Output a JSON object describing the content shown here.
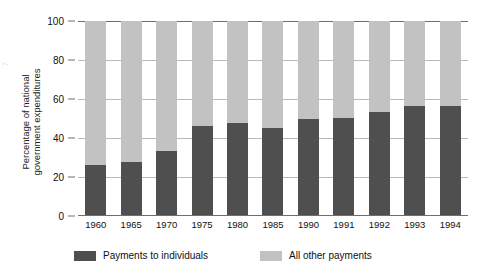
{
  "margin_fragment": "7",
  "chart_data": {
    "type": "bar",
    "stacked": true,
    "title": "",
    "subtitle": "",
    "xlabel": "",
    "ylabel": "Percentage of national government expenditures",
    "ylabel_lines": [
      "Percentage of national",
      "government expenditures"
    ],
    "ylim": [
      0,
      100
    ],
    "yticks": [
      0,
      20,
      40,
      60,
      80,
      100
    ],
    "ytick_labels": [
      "0",
      "20",
      "40",
      "60",
      "80",
      "100"
    ],
    "grid": true,
    "grid_axis": "y",
    "legend_position": "bottom",
    "categories": [
      "1960",
      "1965",
      "1970",
      "1975",
      "1980",
      "1985",
      "1990",
      "1991",
      "1992",
      "1993",
      "1994"
    ],
    "series": [
      {
        "name": "Payments to individuals",
        "color": "#4f4f4f",
        "values": [
          26,
          27.5,
          33.5,
          46,
          47.5,
          45,
          49.5,
          50.5,
          53.5,
          56.5,
          56.5
        ]
      },
      {
        "name": "All other payments",
        "color": "#c2c2c2",
        "values": [
          74,
          72.5,
          66.5,
          54,
          52.5,
          55,
          50.5,
          49.5,
          46.5,
          43.5,
          43.5
        ]
      }
    ]
  },
  "legend": {
    "items": [
      {
        "label": "Payments to individuals",
        "color": "#4f4f4f"
      },
      {
        "label": "All other payments",
        "color": "#c2c2c2"
      }
    ]
  },
  "colors": {
    "individuals": "#4f4f4f",
    "other": "#c2c2c2",
    "axis": "#6e6e6e",
    "grid": "#b9b9b9",
    "text": "#111111",
    "background": "#ffffff"
  }
}
